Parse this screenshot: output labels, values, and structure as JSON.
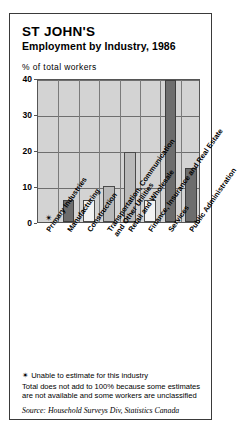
{
  "title": "ST JOHN'S",
  "subtitle": "Employment by Industry, 1986",
  "axis_label": "% of total workers",
  "notes": {
    "star_symbol": "✴",
    "note1": "Unable to estimate for this industry",
    "note2": "Total does not add to 100% because some estimates are not available and some workers are unclassified",
    "source": "Source: Household Surveys Div, Statistics Canada"
  },
  "nodata_marker": "✴",
  "chart_data": {
    "type": "bar",
    "title": "Employment by Industry, 1986",
    "subtitle": "ST JOHN'S",
    "xlabel": "",
    "ylabel": "% of total workers",
    "ylim": [
      0,
      40
    ],
    "yticks": [
      0,
      10,
      20,
      30,
      40
    ],
    "ytick_labels": [
      "0",
      "10",
      "20",
      "30",
      "40"
    ],
    "grid": true,
    "legend": "none",
    "categories": [
      "Primary Industries",
      "Manufacturing",
      "Construction",
      "Transportation, Communication\nand Other Utilities",
      "Retail and Wholesale",
      "Finance, Insurance and Real Estate",
      "Services",
      "Public Administration"
    ],
    "values": [
      null,
      6,
      6,
      10,
      19.5,
      6,
      39.5,
      15
    ],
    "value_notes": [
      "unable to estimate",
      "",
      "",
      "",
      "",
      "",
      "",
      ""
    ],
    "bar_styles": [
      "none",
      "dark",
      "light",
      "mid",
      "mid",
      "light",
      "dark",
      "dark"
    ]
  }
}
